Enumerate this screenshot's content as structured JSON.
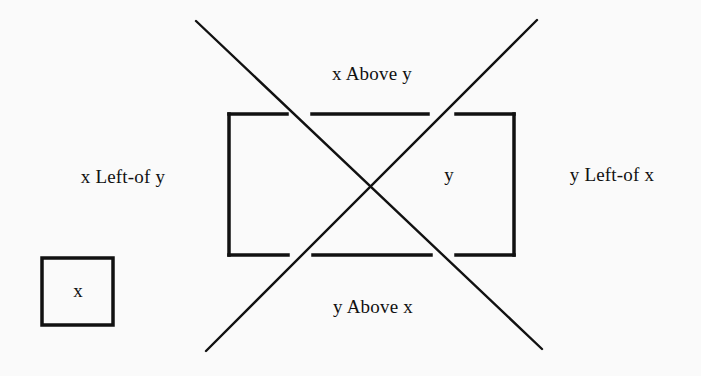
{
  "diagram": {
    "title": "",
    "colors": {
      "background": "#fafafa",
      "ink": "#111111"
    },
    "nodes": [
      {
        "id": "x",
        "label": "x",
        "shape": "square"
      },
      {
        "id": "y",
        "label": "y",
        "shape": "rectangle-with-gaps"
      }
    ],
    "regions": {
      "above": "x Above y",
      "below": "y Above x",
      "left": "x Left-of y",
      "right": "y Left-of x"
    },
    "labels": {
      "x_box": "x",
      "y_box": "y"
    }
  }
}
